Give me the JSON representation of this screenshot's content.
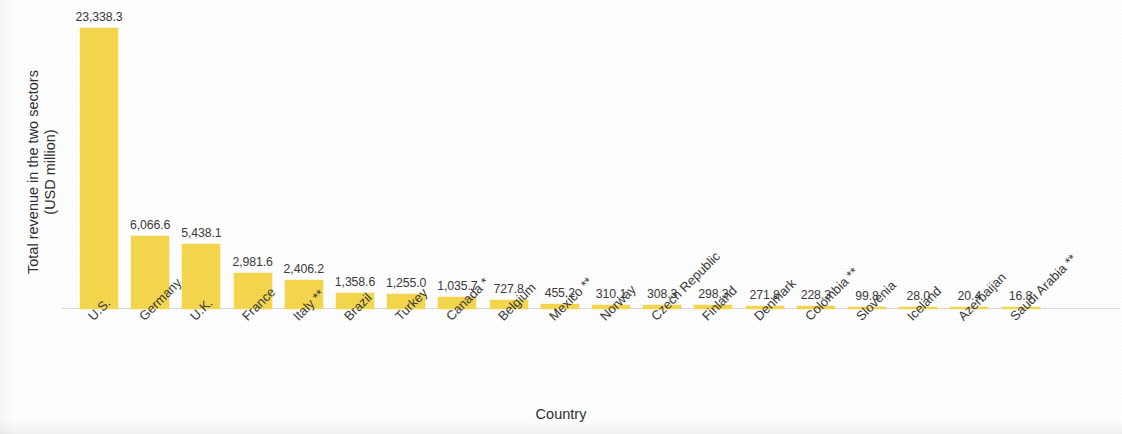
{
  "chart_data": {
    "type": "bar",
    "title": "",
    "subtitle": "",
    "xlabel": "Country",
    "ylabel": "Total revenue in the two sectors\n(USD million)",
    "ylim": [
      0,
      23338.3
    ],
    "grid": false,
    "legend": null,
    "bar_color": "#f5d64e",
    "value_label_color": "#3a3a3a",
    "categories": [
      "U.S.",
      "Germany",
      "U.K.",
      "France",
      "Italy **",
      "Brazil",
      "Turkey",
      "Canada *",
      "Belgium",
      "Mexico **",
      "Norway",
      "Czech Republic",
      "Finland",
      "Denmark",
      "Colombia **",
      "Slovenia",
      "Iceland",
      "Azerbaijan",
      "Saudi Arabia **"
    ],
    "values": [
      23338.3,
      6066.6,
      5438.1,
      2981.6,
      2406.2,
      1358.6,
      1255.0,
      1035.7,
      727.8,
      455.2,
      310.1,
      308.3,
      298.3,
      271.8,
      228.3,
      99.8,
      28.0,
      20.4,
      16.8
    ],
    "value_labels": [
      "23,338.3",
      "6,066.6",
      "5,438.1",
      "2,981.6",
      "2,406.2",
      "1,358.6",
      "1,255.0",
      "1,035.7",
      "727.8",
      "455.2",
      "310.1",
      "308.3",
      "298.3",
      "271.8",
      "228.3",
      "99.8",
      "28.0",
      "20.4",
      "16.8"
    ]
  }
}
